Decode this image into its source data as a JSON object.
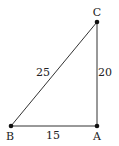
{
  "diagram": {
    "type": "right-triangle",
    "vertices": {
      "A": {
        "label": "A",
        "x": 97,
        "y": 126
      },
      "B": {
        "label": "B",
        "x": 11,
        "y": 126
      },
      "C": {
        "label": "C",
        "x": 97,
        "y": 22
      }
    },
    "sides": {
      "BC": {
        "label": "25"
      },
      "AC": {
        "label": "20"
      },
      "AB": {
        "label": "15"
      }
    },
    "line_color": "#333333",
    "point_color": "#111111"
  }
}
